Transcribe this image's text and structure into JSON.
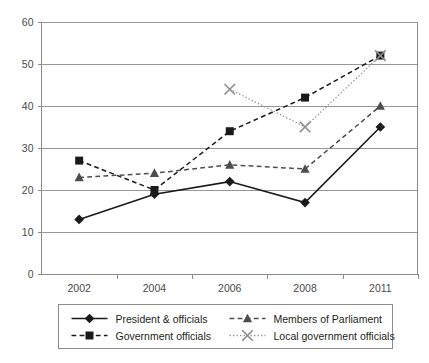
{
  "chart_data": {
    "type": "line",
    "title": "",
    "subtitle": "",
    "xlabel": "",
    "ylabel": "",
    "categories": [
      "2002",
      "2004",
      "2006",
      "2008",
      "2011"
    ],
    "x_tick_labels": [
      "2002",
      "2004",
      "2006",
      "2008",
      "2011"
    ],
    "y_tick_labels": [
      "0",
      "10",
      "20",
      "30",
      "40",
      "50",
      "60"
    ],
    "y_ticks": [
      0,
      10,
      20,
      30,
      40,
      50,
      60
    ],
    "ylim": [
      0,
      60
    ],
    "grid": "horizontal",
    "legend_position": "bottom",
    "series": [
      {
        "name": "President & officials",
        "values": [
          13,
          19,
          22,
          17,
          35
        ],
        "marker": "diamond",
        "line_style": "solid",
        "color": "#1a1a1a"
      },
      {
        "name": "Government officials",
        "values": [
          27,
          20,
          34,
          42,
          52
        ],
        "marker": "square",
        "line_style": "dashed",
        "color": "#1a1a1a"
      },
      {
        "name": "Members of Parliament",
        "values": [
          23,
          24,
          26,
          25,
          40
        ],
        "marker": "triangle",
        "line_style": "dashed",
        "color": "#4d4d4d"
      },
      {
        "name": "Local government officials",
        "values": [
          null,
          null,
          44,
          35,
          52
        ],
        "marker": "cross-x",
        "line_style": "dotted",
        "color": "#8c8c8c"
      }
    ]
  },
  "legend": {
    "entries": [
      {
        "label": "President & officials",
        "marker": "diamond-icon",
        "line_style": "solid"
      },
      {
        "label": "Members of Parliament",
        "marker": "triangle-icon",
        "line_style": "dashed"
      },
      {
        "label": "Government officials",
        "marker": "square-icon",
        "line_style": "dashed"
      },
      {
        "label": "Local government officials",
        "marker": "cross-x-icon",
        "line_style": "dotted"
      }
    ]
  },
  "colors": {
    "axis": "#8b8b8b",
    "grid": "#8b8b8b",
    "text": "#231f20",
    "tick_text": "#4a4a4a",
    "series_1": "#1a1a1a",
    "series_2": "#1a1a1a",
    "series_3": "#4d4d4d",
    "series_4": "#8c8c8c",
    "background": "#ffffff"
  }
}
